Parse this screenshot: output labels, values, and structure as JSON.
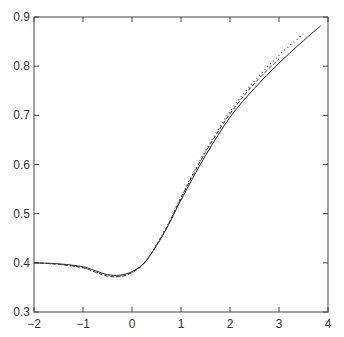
{
  "chart_data": {
    "type": "line",
    "title": "",
    "xlabel": "",
    "ylabel": "",
    "xlim": [
      -2,
      4
    ],
    "ylim": [
      0.3,
      0.9
    ],
    "grid": false,
    "legend": null,
    "x_ticks": [
      "-2",
      "-1",
      "0",
      "1",
      "2",
      "3",
      "4"
    ],
    "y_ticks": [
      "0.3",
      "0.4",
      "0.5",
      "0.6",
      "0.7",
      "0.8",
      "0.9"
    ],
    "series": [
      {
        "name": "solid",
        "style": "solid",
        "color": "#222222",
        "x": [
          -2.0,
          -1.5,
          -1.0,
          -0.75,
          -0.5,
          -0.25,
          0.0,
          0.25,
          0.5,
          0.75,
          1.0,
          1.5,
          2.0,
          2.5,
          3.0,
          3.5,
          3.85
        ],
        "y": [
          0.4,
          0.398,
          0.392,
          0.384,
          0.376,
          0.375,
          0.382,
          0.4,
          0.435,
          0.478,
          0.528,
          0.618,
          0.696,
          0.755,
          0.806,
          0.852,
          0.882
        ]
      },
      {
        "name": "dashed",
        "style": "dashed",
        "color": "#333333",
        "x": [
          -2.0,
          -1.5,
          -1.0,
          -0.75,
          -0.5,
          -0.25,
          0.0,
          0.25,
          0.5,
          0.75,
          1.0,
          1.5,
          2.0,
          2.5,
          3.0
        ],
        "y": [
          0.4,
          0.397,
          0.39,
          0.381,
          0.373,
          0.372,
          0.38,
          0.399,
          0.436,
          0.48,
          0.532,
          0.625,
          0.703,
          0.765,
          0.815
        ]
      },
      {
        "name": "dotted",
        "style": "dotted",
        "color": "#444444",
        "x": [
          -2.0,
          -1.5,
          -1.0,
          -0.75,
          -0.5,
          -0.25,
          0.0,
          0.25,
          0.5,
          0.75,
          1.0,
          1.5,
          2.0,
          2.5,
          3.0,
          3.5
        ],
        "y": [
          0.4,
          0.397,
          0.39,
          0.382,
          0.374,
          0.373,
          0.381,
          0.4,
          0.437,
          0.482,
          0.534,
          0.628,
          0.708,
          0.77,
          0.822,
          0.866
        ]
      }
    ]
  }
}
